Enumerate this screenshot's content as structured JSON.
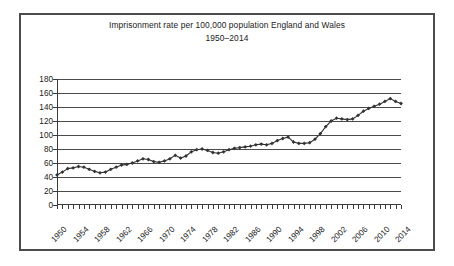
{
  "figure": {
    "title_line1": "Imprisonment rate per 100,000 population England and Wales",
    "title_line2": "1950–2014",
    "border_color": "#4c4c4c",
    "gridline_color": "#4a4a4a",
    "series_color": "#333333"
  },
  "chart_data": {
    "type": "line",
    "title": "Imprisonment rate per 100,000 population England and Wales 1950–2014",
    "xlabel": "",
    "ylabel": "",
    "xlim": [
      1950,
      2014
    ],
    "ylim": [
      0,
      180
    ],
    "yticks": [
      0,
      20,
      40,
      60,
      80,
      100,
      120,
      140,
      160,
      180
    ],
    "ytick_labels": [
      "0",
      "20",
      "40",
      "60",
      "80",
      "100",
      "120",
      "140",
      "160",
      "180"
    ],
    "xticks": [
      1950,
      1954,
      1958,
      1962,
      1966,
      1970,
      1974,
      1978,
      1982,
      1986,
      1990,
      1994,
      1998,
      2002,
      2006,
      2010,
      2014
    ],
    "xtick_labels": [
      "1950",
      "1954",
      "1958",
      "1962",
      "1966",
      "1970",
      "1974",
      "1978",
      "1982",
      "1986",
      "1990",
      "1994",
      "1998",
      "2002",
      "2006",
      "2010",
      "2014"
    ],
    "grid": true,
    "legend": false,
    "marker": "diamond",
    "x": [
      1950,
      1951,
      1952,
      1953,
      1954,
      1955,
      1956,
      1957,
      1958,
      1959,
      1960,
      1961,
      1962,
      1963,
      1964,
      1965,
      1966,
      1967,
      1968,
      1969,
      1970,
      1971,
      1972,
      1973,
      1974,
      1975,
      1976,
      1977,
      1978,
      1979,
      1980,
      1981,
      1982,
      1983,
      1984,
      1985,
      1986,
      1987,
      1988,
      1989,
      1990,
      1991,
      1992,
      1993,
      1994,
      1995,
      1996,
      1997,
      1998,
      1999,
      2000,
      2001,
      2002,
      2003,
      2004,
      2005,
      2006,
      2007,
      2008,
      2009,
      2010,
      2011,
      2012,
      2013,
      2014
    ],
    "values": [
      43,
      47,
      52,
      53,
      55,
      54,
      51,
      48,
      46,
      47,
      51,
      54,
      57,
      58,
      60,
      63,
      66,
      65,
      62,
      61,
      63,
      66,
      71,
      67,
      70,
      76,
      79,
      80,
      78,
      75,
      74,
      76,
      79,
      81,
      82,
      83,
      84,
      86,
      87,
      86,
      88,
      92,
      95,
      97,
      90,
      88,
      88,
      89,
      94,
      102,
      112,
      120,
      124,
      123,
      122,
      123,
      128,
      134,
      138,
      141,
      144,
      148,
      152,
      148,
      145
    ],
    "series": [
      {
        "name": "Imprisonment rate per 100,000 population",
        "values": [
          43,
          47,
          52,
          53,
          55,
          54,
          51,
          48,
          46,
          47,
          51,
          54,
          57,
          58,
          60,
          63,
          66,
          65,
          62,
          61,
          63,
          66,
          71,
          67,
          70,
          76,
          79,
          80,
          78,
          75,
          74,
          76,
          79,
          81,
          82,
          83,
          84,
          86,
          87,
          86,
          88,
          92,
          95,
          97,
          90,
          88,
          88,
          89,
          94,
          102,
          112,
          120,
          124,
          123,
          122,
          123,
          128,
          134,
          138,
          141,
          144,
          148,
          152,
          148,
          145
        ]
      }
    ]
  }
}
